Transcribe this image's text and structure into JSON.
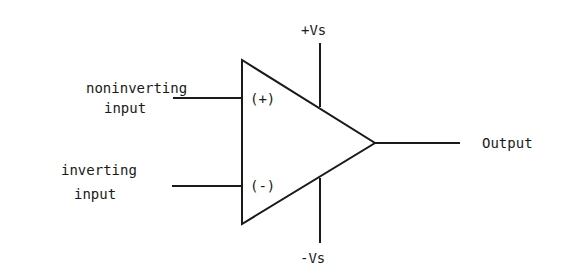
{
  "diagram": {
    "component": "op-amp",
    "inputs": [
      {
        "id": "noninverting",
        "label_line1": "noninverting",
        "label_line2": "input",
        "sign": "(+)"
      },
      {
        "id": "inverting",
        "label_line1": "inverting",
        "label_line2": "input",
        "sign": "(-)"
      }
    ],
    "supply": {
      "positive": "+Vs",
      "negative": "-Vs"
    },
    "output": {
      "label": "Output"
    },
    "colors": {
      "stroke": "#1a1a1a",
      "background": "#ffffff"
    }
  }
}
